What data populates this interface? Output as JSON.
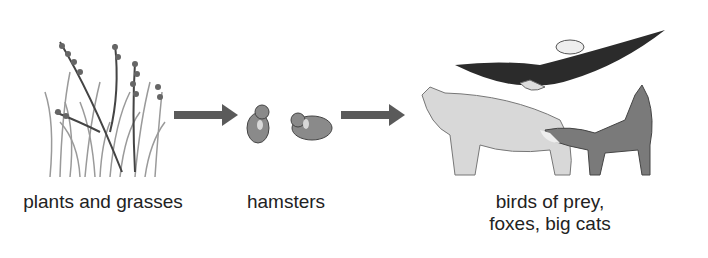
{
  "diagram": {
    "type": "food-chain",
    "nodes": [
      {
        "id": "producers",
        "label": "plants and grasses",
        "icon": "grass-icon"
      },
      {
        "id": "primary-consumers",
        "label": "hamsters",
        "icon": "hamster-icon"
      },
      {
        "id": "predators",
        "label_line1": "birds of prey,",
        "label_line2": "foxes, big cats",
        "icons": [
          "eagle-icon",
          "big-cat-icon",
          "fox-icon"
        ]
      }
    ],
    "edges": [
      {
        "from": "producers",
        "to": "primary-consumers"
      },
      {
        "from": "primary-consumers",
        "to": "predators"
      }
    ],
    "colors": {
      "arrow": "#5a5a5a",
      "text": "#222222",
      "eagle": "#2b2b2b",
      "cat": "#d8d8d8",
      "fox": "#7a7a7a",
      "hamster": "#8a8a8a",
      "grass": "#9a9a9a"
    }
  }
}
